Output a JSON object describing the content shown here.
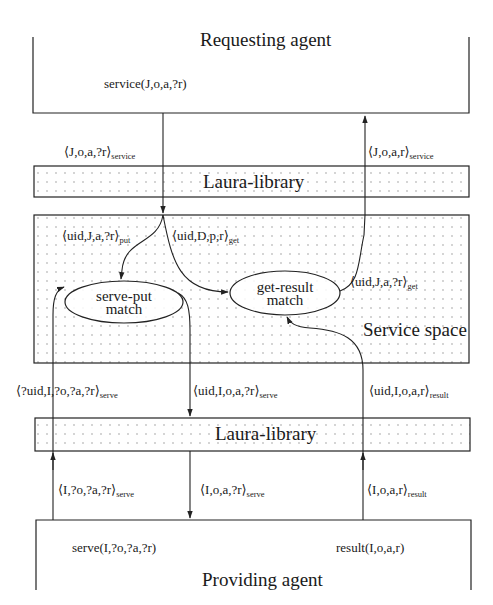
{
  "requesting_agent": {
    "title": "Requesting agent",
    "call": "service(J,o,a,?r)"
  },
  "messages_top": {
    "request": {
      "body": "⟨J,o,a,?r⟩",
      "sub": "service"
    },
    "response": {
      "body": "⟨J,o,a,r⟩",
      "sub": "service"
    }
  },
  "laura_library_top": {
    "title": "Laura-library"
  },
  "service_space": {
    "title": "Service space",
    "put_tuple": {
      "body": "⟨uid,J,a,?r⟩",
      "sub": "put"
    },
    "get_request_tuple": {
      "body": "⟨uid,D,p,r⟩",
      "sub": "get"
    },
    "get_result_tuple": {
      "body": "⟨uid,J,a,?r⟩",
      "sub": "get"
    },
    "nodes": {
      "serve_put": {
        "line1": "serve-put",
        "line2": "match"
      },
      "get_result": {
        "line1": "get-result",
        "line2": "match"
      }
    }
  },
  "messages_middle": {
    "serve_request": {
      "body": "⟨?uid,I,?o,?a,?r⟩",
      "sub": "serve"
    },
    "serve_response": {
      "body": "⟨uid,I,o,a,?r⟩",
      "sub": "serve"
    },
    "result": {
      "body": "⟨uid,I,o,a,r⟩",
      "sub": "result"
    }
  },
  "laura_library_bottom": {
    "title": "Laura-library"
  },
  "messages_bottom": {
    "serve_request": {
      "body": "⟨I,?o,?a,?r⟩",
      "sub": "serve"
    },
    "serve_response": {
      "body": "⟨I,o,a,?r⟩",
      "sub": "serve"
    },
    "result": {
      "body": "⟨I,o,a,r⟩",
      "sub": "result"
    }
  },
  "providing_agent": {
    "title": "Providing agent",
    "serve_call": "serve(I,?o,?a,?r)",
    "result_call": "result(I,o,a,r)"
  },
  "colors": {
    "stroke": "#222222",
    "dots": "#8a8a8a",
    "background": "#ffffff"
  }
}
